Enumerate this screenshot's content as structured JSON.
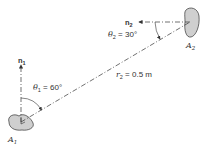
{
  "diagram": {
    "surface1": {
      "label": "A",
      "subscript": "1"
    },
    "surface2": {
      "label": "A",
      "subscript": "2"
    },
    "normal1": {
      "label": "n",
      "subscript": "1"
    },
    "normal2": {
      "label": "n",
      "subscript": "2"
    },
    "angle1": {
      "symbol": "θ",
      "subscript": "1",
      "value": " = 60°"
    },
    "angle2": {
      "symbol": "θ",
      "subscript": "2",
      "value": " = 30°"
    },
    "distance": {
      "symbol": "r",
      "subscript": "2",
      "value": " = 0.5 m"
    },
    "colors": {
      "line": "#333333",
      "surface_fill": "#cfcfcf",
      "surface_stroke": "#333333"
    }
  }
}
